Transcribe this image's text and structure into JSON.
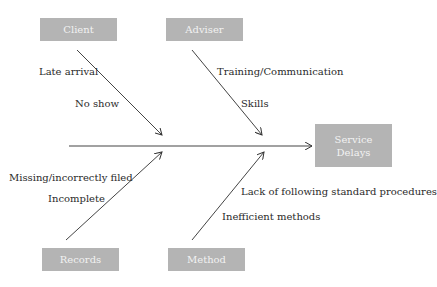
{
  "diagram": {
    "type": "fishbone",
    "effect": {
      "line1": "Service",
      "line2": "Delays"
    },
    "categories": [
      {
        "name": "Client",
        "causes": [
          "Late arrival",
          "No show"
        ]
      },
      {
        "name": "Adviser",
        "causes": [
          "Training/Communication",
          "Skills"
        ]
      },
      {
        "name": "Records",
        "causes": [
          "Missing/incorrectly filed",
          "Incomplete"
        ]
      },
      {
        "name": "Method",
        "causes": [
          "Lack of following standard procedures",
          "Inefficient methods"
        ]
      }
    ],
    "colors": {
      "box": "#b4b4b4",
      "box_text": "#f2f2f2",
      "line": "#333333",
      "text": "#2a2a2a"
    }
  }
}
